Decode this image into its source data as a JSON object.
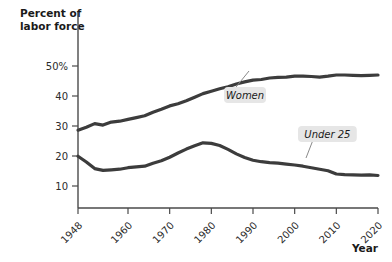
{
  "chart_data": {
    "type": "line",
    "title": "",
    "ylabel": "Percent of labor force",
    "ylabel_line1": "Percent of",
    "ylabel_line2": "labor force",
    "xlabel": "Year",
    "xlim": [
      1948,
      2020
    ],
    "ylim": [
      0,
      55
    ],
    "grid": false,
    "legend_position": "inline-callout",
    "y_ticks": [
      {
        "value": 50,
        "label": "50%"
      },
      {
        "value": 40,
        "label": "40"
      },
      {
        "value": 30,
        "label": "30"
      },
      {
        "value": 20,
        "label": "20"
      },
      {
        "value": 10,
        "label": "10"
      }
    ],
    "x_ticks": [
      {
        "value": 1948,
        "label": "1948"
      },
      {
        "value": 1960,
        "label": "1960"
      },
      {
        "value": 1970,
        "label": "1970"
      },
      {
        "value": 1980,
        "label": "1980"
      },
      {
        "value": 1990,
        "label": "1990"
      },
      {
        "value": 2000,
        "label": "2000"
      },
      {
        "value": 2010,
        "label": "2010"
      },
      {
        "value": 2020,
        "label": "2020"
      }
    ],
    "line_color": "#3c3c3c",
    "series": [
      {
        "name": "Women",
        "annotation": "Women",
        "x": [
          1948,
          1950,
          1952,
          1954,
          1956,
          1958,
          1960,
          1962,
          1964,
          1966,
          1968,
          1970,
          1972,
          1974,
          1976,
          1978,
          1980,
          1982,
          1984,
          1986,
          1988,
          1990,
          1992,
          1994,
          1996,
          1998,
          2000,
          2002,
          2004,
          2006,
          2008,
          2010,
          2012,
          2014,
          2016,
          2018,
          2020
        ],
        "values": [
          28.6,
          29.6,
          30.8,
          30.3,
          31.3,
          31.6,
          32.2,
          32.8,
          33.4,
          34.6,
          35.6,
          36.7,
          37.4,
          38.4,
          39.6,
          40.8,
          41.6,
          42.4,
          43.1,
          44.0,
          44.7,
          45.3,
          45.5,
          46.0,
          46.2,
          46.3,
          46.6,
          46.6,
          46.5,
          46.3,
          46.6,
          47.0,
          47.0,
          46.9,
          46.8,
          46.9,
          47.0
        ]
      },
      {
        "name": "Under 25",
        "annotation": "Under 25",
        "x": [
          1948,
          1950,
          1952,
          1954,
          1956,
          1958,
          1960,
          1962,
          1964,
          1966,
          1968,
          1970,
          1972,
          1974,
          1976,
          1978,
          1980,
          1982,
          1984,
          1986,
          1988,
          1990,
          1992,
          1994,
          1996,
          1998,
          2000,
          2002,
          2004,
          2006,
          2008,
          2010,
          2012,
          2014,
          2016,
          2018,
          2020
        ],
        "values": [
          19.9,
          18.0,
          15.8,
          15.2,
          15.4,
          15.6,
          16.1,
          16.4,
          16.6,
          17.6,
          18.4,
          19.6,
          21.0,
          22.3,
          23.4,
          24.4,
          24.2,
          23.5,
          22.2,
          20.7,
          19.5,
          18.6,
          18.1,
          17.8,
          17.6,
          17.3,
          17.0,
          16.6,
          16.1,
          15.6,
          15.1,
          14.0,
          13.8,
          13.7,
          13.6,
          13.7,
          13.5
        ]
      }
    ]
  },
  "annotations": {
    "women": {
      "label": "Women",
      "box_x": 224,
      "box_y": 87,
      "leader_from_x": 236,
      "leader_from_y": 87,
      "leader_to_x": 249,
      "leader_to_y": 71
    },
    "under25": {
      "label": "Under 25",
      "box_x": 298,
      "box_y": 126,
      "leader_from_x": 313,
      "leader_from_y": 140,
      "leader_to_x": 306,
      "leader_to_y": 158
    }
  },
  "axes": {
    "x_axis_title": "Year",
    "y_axis_title_line1": "Percent of",
    "y_axis_title_line2": "labor force"
  }
}
